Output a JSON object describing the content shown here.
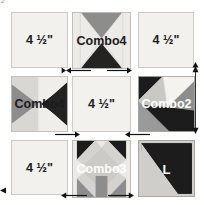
{
  "page": {
    "corner_marker": "2\"",
    "background_color": "#ffffff"
  },
  "palette": {
    "light": "#eceae7",
    "light_alt": "#f2f1ee",
    "medium_gray": "#8d8d8d",
    "dark_gray": "#6f6f6f",
    "black": "#1c1c1c",
    "outline": "#b9b7b4",
    "label_dark": "#1a1a1a",
    "label_light": "#fdfdfd",
    "arrow": "#111111"
  },
  "grid": {
    "rows": 3,
    "cols": 3,
    "blocks": [
      {
        "id": "r1c1",
        "label": "4 ½\"",
        "label_style": "dark",
        "pattern": "plain",
        "row": 1,
        "col": 1
      },
      {
        "id": "r1c2",
        "label": "Combo4",
        "label_style": "dark",
        "pattern": "hourglass-vertical",
        "row": 1,
        "col": 2
      },
      {
        "id": "r1c3",
        "label": "4 ½\"",
        "label_style": "dark",
        "pattern": "plain",
        "row": 1,
        "col": 3
      },
      {
        "id": "r2c1",
        "label": "Combo4",
        "label_style": "dark",
        "pattern": "hourglass-horizontal",
        "row": 2,
        "col": 1
      },
      {
        "id": "r2c2",
        "label": "4 ½\"",
        "label_style": "dark",
        "pattern": "plain",
        "row": 2,
        "col": 2
      },
      {
        "id": "r2c3",
        "label": "Combo2",
        "label_style": "light",
        "pattern": "combo2",
        "row": 2,
        "col": 3
      },
      {
        "id": "r3c1",
        "label": "4 ½\"",
        "label_style": "dark",
        "pattern": "plain",
        "row": 3,
        "col": 1
      },
      {
        "id": "r3c2",
        "label": "Combo3",
        "label_style": "light",
        "pattern": "combo3",
        "row": 3,
        "col": 2
      },
      {
        "id": "r3c3",
        "label": "L",
        "label_style": "L",
        "pattern": "l-triangle",
        "row": 3,
        "col": 3
      }
    ]
  },
  "arrows": [
    {
      "id": "seam-top-left",
      "direction": "left",
      "orientation": "horizontal"
    },
    {
      "id": "seam-top-right",
      "direction": "right",
      "orientation": "horizontal"
    },
    {
      "id": "seam-mid-left",
      "direction": "right",
      "orientation": "horizontal"
    },
    {
      "id": "seam-mid-right",
      "direction": "left",
      "orientation": "horizontal"
    },
    {
      "id": "seam-bottom-left",
      "direction": "left",
      "orientation": "horizontal"
    },
    {
      "id": "seam-bottom-right",
      "direction": "right",
      "orientation": "horizontal"
    },
    {
      "id": "seam-side-up",
      "direction": "up",
      "orientation": "vertical"
    },
    {
      "id": "seam-side-down",
      "direction": "down",
      "orientation": "vertical"
    }
  ]
}
